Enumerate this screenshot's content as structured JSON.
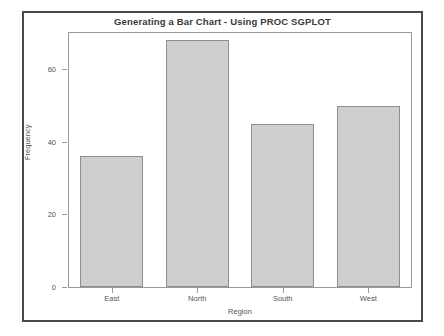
{
  "frame": {
    "border_color": "#4a4a4a",
    "background": "#ffffff"
  },
  "chart_data": {
    "type": "bar",
    "title": "Generating a Bar Chart - Using PROC SGPLOT",
    "xlabel": "Region",
    "ylabel": "Frequency",
    "categories": [
      "East",
      "North",
      "South",
      "West"
    ],
    "values": [
      36,
      68,
      45,
      50
    ],
    "ylim": [
      0,
      70
    ],
    "yticks": [
      0,
      20,
      40,
      60
    ],
    "ytick_labels": [
      "0",
      "20",
      "40",
      "60"
    ],
    "grid": false,
    "legend": null,
    "bar_fill_color": "#cfcfcf",
    "bar_border_color": "#8f8f8f",
    "axis_color": "#9a9a9a",
    "text_color": "#555555",
    "title_color": "#3a3a3a"
  }
}
